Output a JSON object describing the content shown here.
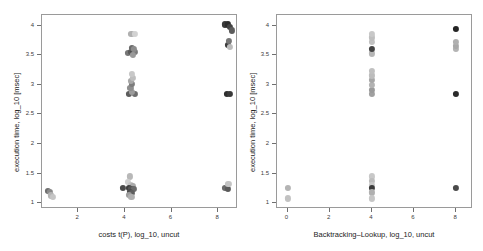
{
  "figure": {
    "background": "#ffffff",
    "frame_color": "#9a9a9a",
    "panel_count": 2
  },
  "chart_data": [
    {
      "type": "scatter",
      "panel": "left",
      "title": "",
      "xlabel": "costs t(P), log_10, uncut",
      "ylabel": "execution time, log_10 [msec]",
      "xlim": [
        0.45,
        8.85
      ],
      "ylim": [
        0.9,
        4.18
      ],
      "xticks": [
        2,
        4,
        6,
        8
      ],
      "xticklabels": [
        "2",
        "4",
        "6",
        "8"
      ],
      "yticks": [
        1,
        1.5,
        2,
        2.5,
        3,
        3.5,
        4
      ],
      "yticklabels": [
        "1",
        "1.5",
        "2",
        "2.5",
        "3",
        "3.5",
        "4"
      ],
      "grid": false,
      "legend": "none",
      "points": [
        {
          "x": 0.72,
          "y": 1.2,
          "c": "#6e6e6e"
        },
        {
          "x": 0.8,
          "y": 1.19,
          "c": "#8a8a8a"
        },
        {
          "x": 0.84,
          "y": 1.13,
          "c": "#b4b4b4"
        },
        {
          "x": 0.9,
          "y": 1.1,
          "c": "#c6c6c6"
        },
        {
          "x": 3.92,
          "y": 1.25,
          "c": "#4a4a4a"
        },
        {
          "x": 4.22,
          "y": 1.45,
          "c": "#b8b8b8"
        },
        {
          "x": 4.12,
          "y": 1.36,
          "c": "#cfcfcf"
        },
        {
          "x": 4.26,
          "y": 1.31,
          "c": "#c2c2c2"
        },
        {
          "x": 4.34,
          "y": 1.29,
          "c": "#aaaaaa"
        },
        {
          "x": 4.18,
          "y": 1.26,
          "c": "#3f3f3f"
        },
        {
          "x": 4.28,
          "y": 1.24,
          "c": "#555555"
        },
        {
          "x": 4.38,
          "y": 1.24,
          "c": "#6b6b6b"
        },
        {
          "x": 4.22,
          "y": 1.19,
          "c": "#4c4c4c"
        },
        {
          "x": 4.32,
          "y": 1.17,
          "c": "#5e5e5e"
        },
        {
          "x": 4.16,
          "y": 1.14,
          "c": "#9d9d9d"
        },
        {
          "x": 4.28,
          "y": 1.11,
          "c": "#b0b0b0"
        },
        {
          "x": 8.3,
          "y": 1.26,
          "c": "#6a6a6a"
        },
        {
          "x": 8.4,
          "y": 1.24,
          "c": "#5a5a5a"
        },
        {
          "x": 8.44,
          "y": 1.32,
          "c": "#c4c4c4"
        },
        {
          "x": 4.18,
          "y": 2.85,
          "c": "#5c5c5c"
        },
        {
          "x": 4.44,
          "y": 2.85,
          "c": "#6e6e6e"
        },
        {
          "x": 4.3,
          "y": 2.88,
          "c": "#9c9c9c"
        },
        {
          "x": 4.24,
          "y": 2.95,
          "c": "#8e8e8e"
        },
        {
          "x": 4.32,
          "y": 3.01,
          "c": "#7c7c7c"
        },
        {
          "x": 4.26,
          "y": 3.06,
          "c": "#a8a8a8"
        },
        {
          "x": 4.34,
          "y": 3.12,
          "c": "#bebebe"
        },
        {
          "x": 4.3,
          "y": 3.18,
          "c": "#c8c8c8"
        },
        {
          "x": 4.14,
          "y": 3.54,
          "c": "#777777"
        },
        {
          "x": 4.26,
          "y": 3.56,
          "c": "#5a5a5a"
        },
        {
          "x": 4.36,
          "y": 3.57,
          "c": "#4e4e4e"
        },
        {
          "x": 4.44,
          "y": 3.56,
          "c": "#7a7a7a"
        },
        {
          "x": 4.3,
          "y": 3.62,
          "c": "#6a6a6a"
        },
        {
          "x": 4.4,
          "y": 3.6,
          "c": "#8c8c8c"
        },
        {
          "x": 4.34,
          "y": 3.5,
          "c": "#9a9a9a"
        },
        {
          "x": 4.28,
          "y": 3.86,
          "c": "#b0b0b0"
        },
        {
          "x": 4.44,
          "y": 3.86,
          "c": "#d2d2d2"
        },
        {
          "x": 8.36,
          "y": 2.85,
          "c": "#2e2e2e"
        },
        {
          "x": 8.5,
          "y": 2.85,
          "c": "#3a3a3a"
        },
        {
          "x": 8.42,
          "y": 3.68,
          "c": "#3c3c3c"
        },
        {
          "x": 8.52,
          "y": 3.64,
          "c": "#bcbcbc"
        },
        {
          "x": 8.46,
          "y": 3.74,
          "c": "#777777"
        },
        {
          "x": 8.3,
          "y": 4.02,
          "c": "#3a3a3a"
        },
        {
          "x": 8.42,
          "y": 4.02,
          "c": "#2c2c2c"
        },
        {
          "x": 8.52,
          "y": 3.98,
          "c": "#444444"
        },
        {
          "x": 8.58,
          "y": 3.92,
          "c": "#5c5c5c"
        }
      ]
    },
    {
      "type": "scatter",
      "panel": "right",
      "title": "",
      "xlabel": "Backtracking–Lookup, log_10, uncut",
      "ylabel": "execution time, log_10 [msec]",
      "xlim": [
        -0.5,
        8.8
      ],
      "ylim": [
        0.9,
        4.18
      ],
      "xticks": [
        0,
        2,
        4,
        6,
        8
      ],
      "xticklabels": [
        "0",
        "2",
        "4",
        "6",
        "8"
      ],
      "yticks": [
        1,
        1.5,
        2,
        2.5,
        3,
        3.5,
        4
      ],
      "yticklabels": [
        "1",
        "1.5",
        "2",
        "2.5",
        "3",
        "3.5",
        "4"
      ],
      "grid": false,
      "legend": "none",
      "points": [
        {
          "x": 0.0,
          "y": 1.26,
          "c": "#b4b4b4"
        },
        {
          "x": 0.0,
          "y": 1.08,
          "c": "#c2c2c2"
        },
        {
          "x": 4.0,
          "y": 1.45,
          "c": "#c8c8c8"
        },
        {
          "x": 4.0,
          "y": 1.38,
          "c": "#bcbcbc"
        },
        {
          "x": 4.0,
          "y": 1.31,
          "c": "#cacaca"
        },
        {
          "x": 4.0,
          "y": 1.25,
          "c": "#3a3a3a"
        },
        {
          "x": 4.0,
          "y": 1.18,
          "c": "#b0b0b0"
        },
        {
          "x": 4.0,
          "y": 1.08,
          "c": "#c6c6c6"
        },
        {
          "x": 8.0,
          "y": 1.26,
          "c": "#4a4a4a"
        },
        {
          "x": 4.0,
          "y": 2.85,
          "c": "#a0a0a0"
        },
        {
          "x": 4.0,
          "y": 2.91,
          "c": "#9a9a9a"
        },
        {
          "x": 4.0,
          "y": 3.0,
          "c": "#b2b2b2"
        },
        {
          "x": 4.0,
          "y": 3.08,
          "c": "#a6a6a6"
        },
        {
          "x": 4.0,
          "y": 3.16,
          "c": "#bcbcbc"
        },
        {
          "x": 4.0,
          "y": 3.24,
          "c": "#c0c0c0"
        },
        {
          "x": 4.0,
          "y": 3.53,
          "c": "#b6b6b6"
        },
        {
          "x": 4.0,
          "y": 3.6,
          "c": "#444444"
        },
        {
          "x": 4.0,
          "y": 3.72,
          "c": "#c2c2c2"
        },
        {
          "x": 4.0,
          "y": 3.8,
          "c": "#bebebe"
        },
        {
          "x": 4.0,
          "y": 3.86,
          "c": "#c8c8c8"
        },
        {
          "x": 8.0,
          "y": 2.85,
          "c": "#2a2a2a"
        },
        {
          "x": 8.0,
          "y": 3.6,
          "c": "#b4b4b4"
        },
        {
          "x": 8.0,
          "y": 3.66,
          "c": "#a8a8a8"
        },
        {
          "x": 8.0,
          "y": 3.72,
          "c": "#b0b0b0"
        },
        {
          "x": 8.0,
          "y": 3.94,
          "c": "#242424"
        }
      ]
    }
  ]
}
